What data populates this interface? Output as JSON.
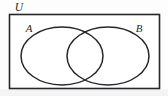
{
  "figure": {
    "type": "venn-diagram",
    "width": 168,
    "height": 96,
    "background_color": "#fdfdfd",
    "stroke_color": "#26262b"
  },
  "labels": {
    "universe": "U",
    "set_a": "A",
    "set_b": "B"
  },
  "universe_rect": {
    "x": 9.5,
    "y": 14.5,
    "width": 150,
    "height": 74
  },
  "circles": [
    {
      "name": "set-a",
      "label": "A",
      "cx": 62,
      "cy": 56,
      "rx": 41,
      "ry": 29
    },
    {
      "name": "set-b",
      "label": "B",
      "cx": 108,
      "cy": 56,
      "rx": 41,
      "ry": 29
    }
  ],
  "label_positions": {
    "universe": {
      "x": 19,
      "y": 11
    },
    "set_a": {
      "x": 29,
      "y": 32
    },
    "set_b": {
      "x": 139,
      "y": 32
    }
  }
}
